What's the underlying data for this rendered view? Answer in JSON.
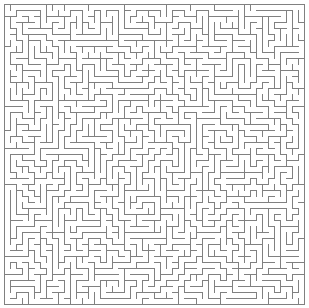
{
  "figure": {
    "type": "maze",
    "title": "",
    "width_px": 309,
    "height_px": 308,
    "background_color": "#ffffff"
  },
  "maze": {
    "kind": "perfect-maze",
    "shape": "rectangular",
    "columns": 50,
    "rows": 50,
    "cell_size_px": 6,
    "origin_x_px": 4,
    "origin_y_px": 4,
    "wall_color": "#808080",
    "wall_thickness_px": 1,
    "border": "closed",
    "border_top": true,
    "border_right": true,
    "border_bottom": true,
    "border_left": true,
    "entrance": "none",
    "exit": "none",
    "seed": 20250514
  },
  "labels": {
    "caption": "",
    "legend": []
  }
}
